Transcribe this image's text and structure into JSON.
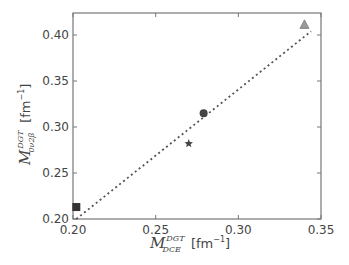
{
  "chart_data": {
    "type": "scatter",
    "title": "",
    "xlabel": "M_DCE^DGT [fm^-1]",
    "ylabel": "M_(0ν2β)^DGT [fm^-1]",
    "xlim": [
      0.2,
      0.35
    ],
    "ylim": [
      0.2,
      0.42
    ],
    "xticks": [
      "0.20",
      "0.25",
      "0.30",
      "0.35"
    ],
    "yticks": [
      "0.20",
      "0.25",
      "0.30",
      "0.35",
      "0.40"
    ],
    "grid": false,
    "legend": null,
    "series": [
      {
        "name": "square",
        "marker": "square",
        "color": "#333333",
        "x": [
          0.202
        ],
        "y": [
          0.213
        ]
      },
      {
        "name": "star",
        "marker": "star",
        "color": "#444444",
        "x": [
          0.27
        ],
        "y": [
          0.282
        ]
      },
      {
        "name": "circle",
        "marker": "circle",
        "color": "#444444",
        "x": [
          0.279
        ],
        "y": [
          0.315
        ]
      },
      {
        "name": "triangle",
        "marker": "triangle",
        "color": "#999999",
        "x": [
          0.34
        ],
        "y": [
          0.411
        ]
      }
    ],
    "fit_line": {
      "style": "dotted",
      "color": "#555555",
      "x": [
        0.202,
        0.344
      ],
      "y": [
        0.2,
        0.404
      ]
    }
  },
  "axes": {
    "x_label_main": "M",
    "x_label_sup": "DGT",
    "x_label_sub": "DCE",
    "x_label_unit": "[fm",
    "x_label_exp": "−1",
    "x_label_close": "]",
    "y_label_main": "M",
    "y_label_sup": "DGT",
    "y_label_sub": "0ν2β",
    "y_label_unit": "[fm",
    "y_label_exp": "−1",
    "y_label_close": "]"
  }
}
